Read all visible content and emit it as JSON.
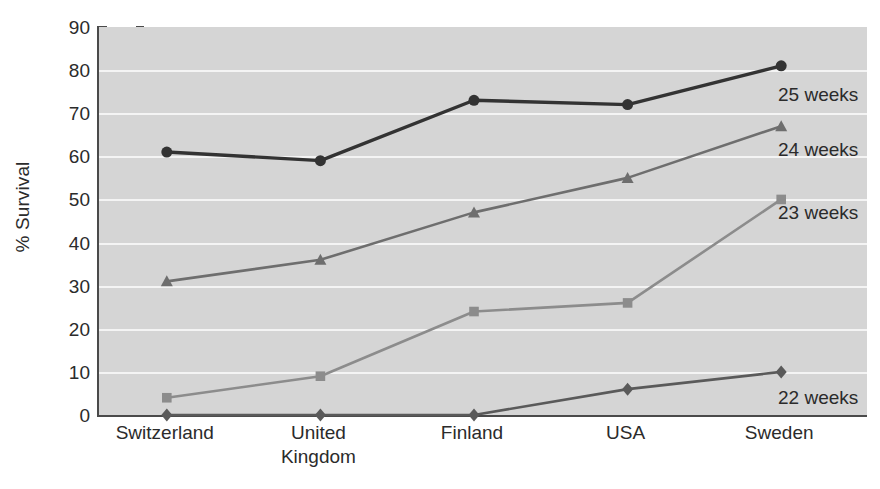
{
  "chart_data": {
    "type": "line",
    "title": "",
    "xlabel": "",
    "ylabel": "% Survival",
    "ylim": [
      0,
      90
    ],
    "yticks": [
      0,
      10,
      20,
      30,
      40,
      50,
      60,
      70,
      80,
      90
    ],
    "grid": true,
    "legend_position": "inline-right",
    "categories": [
      "Switzerland",
      "United Kingdom",
      "Finland",
      "USA",
      "Sweden"
    ],
    "category_lines": [
      [
        "Switzerland"
      ],
      [
        "United",
        "Kingdom"
      ],
      [
        "Finland"
      ],
      [
        "USA"
      ],
      [
        "Sweden"
      ]
    ],
    "series": [
      {
        "name": "25 weeks",
        "label": "25 weeks",
        "marker": "circle",
        "color": "#333333",
        "values": [
          61,
          59,
          73,
          72,
          81
        ]
      },
      {
        "name": "24 weeks",
        "label": "24 weeks",
        "marker": "triangle",
        "color": "#6e6e6e",
        "values": [
          31,
          36,
          47,
          55,
          67
        ]
      },
      {
        "name": "23 weeks",
        "label": "23 weeks",
        "marker": "square",
        "color": "#8c8c8c",
        "values": [
          4,
          9,
          24,
          26,
          50
        ]
      },
      {
        "name": "22 weeks",
        "label": "22 weeks",
        "marker": "diamond",
        "color": "#5a5a5a",
        "values": [
          0,
          0,
          0,
          6,
          10
        ]
      }
    ]
  },
  "axis": {
    "y_title": "% Survival",
    "y_tick_labels": [
      "90",
      "80",
      "70",
      "60",
      "50",
      "40",
      "30",
      "20",
      "10",
      "0"
    ]
  },
  "series_labels": [
    {
      "text": "25 weeks",
      "left": 778,
      "top": 85
    },
    {
      "text": "24 weeks",
      "left": 778,
      "top": 140
    },
    {
      "text": "23 weeks",
      "left": 778,
      "top": 203
    },
    {
      "text": "22 weeks",
      "left": 778,
      "top": 388
    }
  ],
  "colors": {
    "plot_background": "#d5d5d5",
    "gridline": "#f4f4f4",
    "axis": "#4a4a4a",
    "page_background": "#ffffff",
    "text": "#2b2b2b"
  }
}
